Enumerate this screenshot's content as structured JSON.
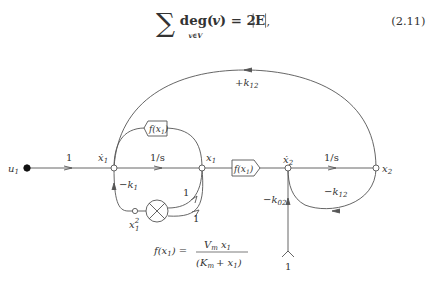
{
  "equation": {
    "sum_symbol": "∑",
    "body": "deg(",
    "var": "v",
    "close": ") = 2",
    "set": "E",
    "subscript": "v∈V",
    "trailing": ",",
    "number": "(2.11)"
  },
  "diagram": {
    "type": "signal-flow-graph",
    "nodes": {
      "u1": {
        "label": "u",
        "sub": "1"
      },
      "x1dot": {
        "label": "ẋ",
        "sub": "1"
      },
      "x1": {
        "label": "x",
        "sub": "1"
      },
      "x2dot": {
        "label": "ẋ",
        "sub": "2"
      },
      "x2": {
        "label": "x",
        "sub": "2"
      },
      "x1sq": {
        "label": "x",
        "sub": "1",
        "sup": "2"
      },
      "source": {
        "label": "1"
      }
    },
    "branches": {
      "u1_to_x1dot": "1",
      "x1dot_to_x1": "1/s",
      "x2dot_to_x2": "1/s",
      "feedback_top": {
        "sign": "+k",
        "sub": "12"
      },
      "feedback_x2": {
        "sign": "−k",
        "sub": "12"
      },
      "feedback_k1": {
        "sign": "−k",
        "sub": "1"
      },
      "source_k02": {
        "sign": "−k",
        "sub": "02"
      },
      "mult_in_1": "1",
      "mult_in_2": "1"
    },
    "blocks": {
      "f_top": {
        "f": "f",
        "arg": "(x",
        "sub": "1",
        "close": ")"
      },
      "f_mid": {
        "f": "f",
        "arg": "(x",
        "sub": "1",
        "close": ")"
      }
    },
    "formula": {
      "lhs": "f(x",
      "lhs_sub": "1",
      "lhs_close": ") =",
      "num_V": "V",
      "num_V_sub": "m",
      "num_x": "x",
      "num_x_sub": "1",
      "den_open": "(K",
      "den_K_sub": "m",
      "den_plus": "+ x",
      "den_x_sub": "1",
      "den_close": ")"
    }
  }
}
